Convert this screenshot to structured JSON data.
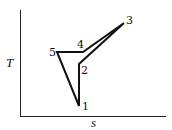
{
  "diagram": {
    "type": "T-s cycle diagram",
    "axes": {
      "y_label": "T",
      "x_label": "s"
    },
    "states": [
      {
        "id": "1",
        "label": "1"
      },
      {
        "id": "2",
        "label": "2"
      },
      {
        "id": "3",
        "label": "3"
      },
      {
        "id": "4",
        "label": "4"
      },
      {
        "id": "5",
        "label": "5"
      }
    ],
    "path_order": [
      "1",
      "2",
      "3",
      "4",
      "5",
      "1"
    ],
    "line_color": "#111111"
  }
}
